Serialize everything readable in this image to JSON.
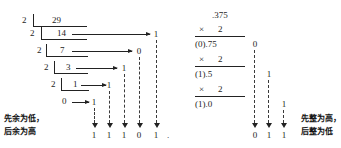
{
  "figure": {
    "title_present": false,
    "left_panel": {
      "method": "repeated division by 2 (integer part)",
      "divisor": "2",
      "rows": [
        {
          "divisor": "2",
          "dividend": "29",
          "remainder": ""
        },
        {
          "divisor": "2",
          "dividend": "14",
          "remainder": "1"
        },
        {
          "divisor": "2",
          "dividend": "7",
          "remainder": "0"
        },
        {
          "divisor": "2",
          "dividend": "3",
          "remainder": "1"
        },
        {
          "divisor": "2",
          "dividend": "1",
          "remainder": "1"
        },
        {
          "divisor": "",
          "dividend": "0",
          "remainder": "1"
        }
      ],
      "caption_line1": "先余为低，",
      "caption_line2": "后余为高",
      "result_digits": [
        "1",
        "1",
        "1",
        "0",
        "1"
      ],
      "result_point": "."
    },
    "right_panel": {
      "method": "repeated multiplication by 2 (fraction part)",
      "operand": ".375",
      "multiplier_symbol": "×",
      "multiplier": "2",
      "steps": [
        {
          "product": "(0).75",
          "carry": "0"
        },
        {
          "product": "(1).5",
          "carry": "1"
        },
        {
          "product": "(1).0",
          "carry": "1"
        }
      ],
      "caption_line1": "先整为高，",
      "caption_line2": "后整为低",
      "result_digits": [
        "0",
        "1",
        "1"
      ]
    }
  }
}
